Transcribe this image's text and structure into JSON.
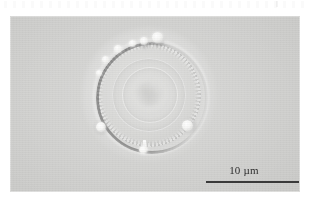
{
  "figure": {
    "type": "light-micrograph",
    "modality": "differential-interference-contrast",
    "colormode": "grayscale",
    "panel": {
      "background_color": "#cdcdcb",
      "page_color": "#ffffff"
    }
  },
  "scalebar": {
    "label": "10 µm",
    "value": 10,
    "unit": "µm",
    "line_color": "#3a3a3a",
    "position": "bottom-right"
  },
  "specimen": {
    "shape": "circular valve",
    "features": [
      "radial costae striations",
      "dark beaded marginal rim",
      "concentric inner discs",
      "marginal bright knobs",
      "ventral spine"
    ]
  },
  "knobs": [
    {
      "name": "knob-top-right",
      "left": 56,
      "top": -10,
      "size": 11
    },
    {
      "name": "knob-top-center",
      "left": 44,
      "top": -5,
      "size": 8
    },
    {
      "name": "knob-upper-left",
      "left": 18,
      "top": 3,
      "size": 8
    },
    {
      "name": "knob-left-upper",
      "left": 3,
      "top": 16,
      "size": 7
    },
    {
      "name": "knob-bottom-left",
      "left": 0,
      "top": 80,
      "size": 10
    },
    {
      "name": "knob-bottom-right",
      "left": 86,
      "top": 78,
      "size": 11
    },
    {
      "name": "knob-ventral",
      "left": 43,
      "top": 104,
      "size": 9
    }
  ]
}
